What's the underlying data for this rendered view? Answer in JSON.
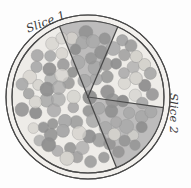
{
  "figure": {
    "kind": "pizza-pie-slice-diagram",
    "background_color": "#fdfdfd",
    "labels": [
      {
        "id": "slice1",
        "text": "Slice 1",
        "rotation_deg": -21,
        "x": 27,
        "y": 30
      },
      {
        "id": "slice2",
        "text": "Slice 2",
        "rotation_deg": 90,
        "x": 173,
        "y": 93
      }
    ]
  },
  "chart_data": {
    "type": "pie",
    "title": "",
    "xlabel": "",
    "ylabel": "",
    "categories": [
      "Slice 1",
      "Slice 2",
      "Remainder"
    ],
    "values": [
      12.5,
      16.7,
      70.8
    ],
    "unit": "percent of whole pie",
    "highlighted": [
      "Slice 1",
      "Slice 2"
    ],
    "legend_position": "none",
    "grid": false,
    "slices": [
      {
        "name": "Slice 1",
        "start_angle_deg": 248,
        "end_angle_deg": 293,
        "sweep_deg": 45,
        "fraction": 0.125,
        "shaded": true,
        "fill": "#b9b9b9"
      },
      {
        "name": "Slice 2",
        "start_angle_deg": 8,
        "end_angle_deg": 68,
        "sweep_deg": 60,
        "fraction": 0.167,
        "shaded": true,
        "fill": "#b9b9b9"
      },
      {
        "name": "Remainder",
        "start_angle_deg": 293,
        "end_angle_deg": 368,
        "sweep_deg": 255,
        "fraction": 0.708,
        "shaded": false,
        "fill": "#eeece8"
      }
    ]
  },
  "geometry": {
    "center_x": 88,
    "center_y": 97,
    "outer_radius": 82,
    "inner_radius": 76,
    "crust_ring": true
  },
  "colors": {
    "outline": "#4a4a4a",
    "crust_fill": "#f3f1ee",
    "cheese_fill": "#eeece8",
    "shaded_fill": "#b9b9b9",
    "topping_dark": "#909090",
    "topping_mid": "#a8a8a8",
    "topping_light": "#d4d2cd",
    "label_text": "#3a3a3a"
  },
  "toppings": {
    "count": 96,
    "radius_px": 6.4,
    "description": "pepperoni rounds scattered over the whole pie"
  }
}
